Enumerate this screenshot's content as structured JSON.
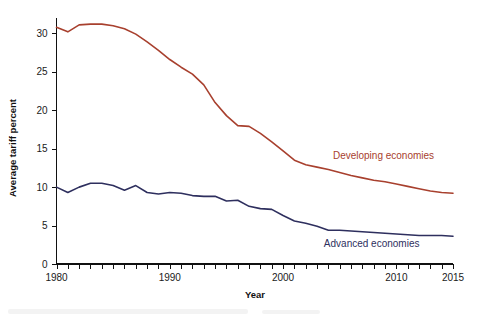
{
  "chart_data": {
    "type": "line",
    "title": "",
    "xlabel": "Year",
    "ylabel": "Average tariff percent",
    "xlim": [
      1980,
      2015
    ],
    "ylim": [
      0,
      32
    ],
    "y_ticks": [
      0,
      5,
      10,
      15,
      20,
      25,
      30
    ],
    "x_ticks_labeled": [
      1980,
      1990,
      2000,
      2010,
      2015
    ],
    "x_tick_interval": 1,
    "grid": false,
    "legend_position": "inline-right",
    "series": [
      {
        "name": "Developing economies",
        "color": "#a8402e",
        "label_color": "#a8402e",
        "label_x": 2004.4,
        "label_y": 13.6,
        "x": [
          1980,
          1981,
          1982,
          1983,
          1984,
          1985,
          1986,
          1987,
          1988,
          1989,
          1990,
          1991,
          1992,
          1993,
          1994,
          1995,
          1996,
          1997,
          1998,
          1999,
          2000,
          2001,
          2002,
          2003,
          2004,
          2005,
          2006,
          2007,
          2008,
          2009,
          2010,
          2011,
          2012,
          2013,
          2014,
          2015
        ],
        "values": [
          30.8,
          30.2,
          31.1,
          31.2,
          31.2,
          31.0,
          30.6,
          29.9,
          28.9,
          27.8,
          26.6,
          25.6,
          24.7,
          23.3,
          21.0,
          19.3,
          18.0,
          17.9,
          17.0,
          15.9,
          14.7,
          13.5,
          12.9,
          12.6,
          12.3,
          11.9,
          11.5,
          11.2,
          10.9,
          10.7,
          10.4,
          10.1,
          9.8,
          9.5,
          9.3,
          9.2
        ]
      },
      {
        "name": "Advanced economies",
        "color": "#2e2f5e",
        "label_color": "#2e2f5e",
        "label_x": 2003.6,
        "label_y": 2.2,
        "x": [
          1980,
          1981,
          1982,
          1983,
          1984,
          1985,
          1986,
          1987,
          1988,
          1989,
          1990,
          1991,
          1992,
          1993,
          1994,
          1995,
          1996,
          1997,
          1998,
          1999,
          2000,
          2001,
          2002,
          2003,
          2004,
          2005,
          2006,
          2007,
          2008,
          2009,
          2010,
          2011,
          2012,
          2013,
          2014,
          2015
        ],
        "values": [
          10.0,
          9.3,
          10.0,
          10.5,
          10.5,
          10.2,
          9.6,
          10.2,
          9.3,
          9.1,
          9.3,
          9.2,
          8.9,
          8.8,
          8.8,
          8.2,
          8.3,
          7.5,
          7.2,
          7.1,
          6.3,
          5.6,
          5.3,
          4.9,
          4.4,
          4.4,
          4.3,
          4.2,
          4.1,
          4.0,
          3.9,
          3.8,
          3.7,
          3.7,
          3.7,
          3.6
        ]
      }
    ]
  },
  "axes": {
    "y_axis_title": "Average tariff percent",
    "x_axis_title": "Year",
    "y_tick_labels": [
      "0",
      "5",
      "10",
      "15",
      "20",
      "25",
      "30"
    ],
    "x_tick_labels": [
      "1980",
      "1990",
      "2000",
      "2010",
      "2015"
    ]
  },
  "legend": {
    "developing": "Developing economies",
    "advanced": "Advanced economies"
  },
  "colors": {
    "developing": "#a8402e",
    "advanced": "#2e2f5e",
    "axis": "#111111",
    "background": "#ffffff"
  }
}
